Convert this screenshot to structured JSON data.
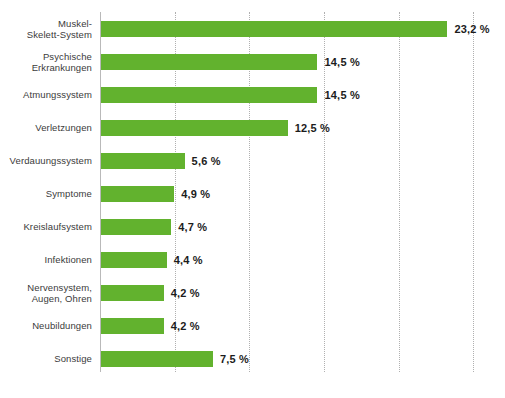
{
  "chart_data": {
    "type": "bar",
    "orientation": "horizontal",
    "title": "",
    "subtitle": "",
    "xlabel": "",
    "ylabel": "",
    "xlim": [
      0,
      27
    ],
    "grid": true,
    "grid_axis": "x",
    "gridline_values": [
      5,
      10,
      15,
      20,
      25
    ],
    "legend": null,
    "bar_color": "#62b22e",
    "value_suffix": " %",
    "decimal_separator": ",",
    "categories": [
      "Muskel-\nSkelett-System",
      "Psychische\nErkrankungen",
      "Atmungssystem",
      "Verletzungen",
      "Verdauungssystem",
      "Symptome",
      "Kreislaufsystem",
      "Infektionen",
      "Nervensystem,\nAugen, Ohren",
      "Neubildungen",
      "Sonstige"
    ],
    "values": [
      23.2,
      14.5,
      14.5,
      12.5,
      5.6,
      4.9,
      4.7,
      4.4,
      4.2,
      4.2,
      7.5
    ],
    "value_labels": [
      "23,2 %",
      "14,5 %",
      "14,5 %",
      "12,5 %",
      "5,6 %",
      "4,9 %",
      "4,7 %",
      "4,4 %",
      "4,2 %",
      "4,2 %",
      "7,5 %"
    ]
  },
  "footnote": {
    "text": ""
  }
}
